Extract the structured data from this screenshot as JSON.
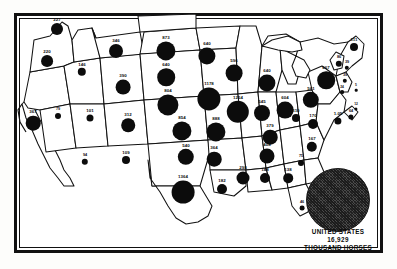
{
  "figure": {
    "type": "proportional-symbol-map",
    "units": "thousand horses"
  },
  "legend": {
    "country_label": "UNITED STATES",
    "amount": "16,929",
    "units_label": "THOUSAND HORSES"
  },
  "chart_data": {
    "type": "scatter",
    "title": "UNITED STATES 16,929 THOUSAND HORSES",
    "xlabel": "",
    "ylabel": "",
    "value_units": "thousand horses",
    "symbol": "graduated circle, area proportional to value",
    "total": 16929,
    "categories": [
      "Washington",
      "Oregon",
      "California",
      "Idaho",
      "Nevada",
      "Montana",
      "Wyoming",
      "Utah",
      "Arizona",
      "Colorado",
      "New Mexico",
      "North Dakota",
      "South Dakota",
      "Nebraska",
      "Kansas",
      "Oklahoma",
      "Texas",
      "Minnesota",
      "Iowa",
      "Missouri",
      "Arkansas",
      "Louisiana",
      "Wisconsin",
      "Illinois",
      "Michigan",
      "Indiana",
      "Ohio",
      "Kentucky",
      "Tennessee",
      "Mississippi",
      "Alabama",
      "Georgia",
      "Florida",
      "South Carolina",
      "North Carolina",
      "Virginia",
      "West Virginia",
      "Pennsylvania",
      "New York",
      "Maryland",
      "Delaware",
      "New Jersey",
      "Maine",
      "Vermont",
      "New Hampshire",
      "Massachusetts",
      "Connecticut",
      "Rhode Island"
    ],
    "values": [
      227,
      220,
      367,
      146,
      79,
      346,
      390,
      101,
      94,
      312,
      109,
      873,
      640,
      1178,
      854,
      540,
      1364,
      640,
      1254,
      888,
      364,
      182,
      596,
      1254,
      640,
      545,
      604,
      379,
      408,
      298,
      148,
      138,
      46,
      75,
      167,
      170,
      110,
      561,
      667,
      105,
      12,
      64,
      111,
      86,
      39,
      39,
      24,
      5
    ],
    "points": [
      {
        "state": "Washington",
        "abbr": "WA",
        "value": 227,
        "label": "227",
        "x": 57,
        "y": 29,
        "r": 6.0
      },
      {
        "state": "Oregon",
        "abbr": "OR",
        "value": 220,
        "label": "220",
        "x": 47,
        "y": 61,
        "r": 5.9
      },
      {
        "state": "California",
        "abbr": "CA",
        "value": 367,
        "label": "367",
        "x": 33,
        "y": 123,
        "r": 7.3
      },
      {
        "state": "Idaho",
        "abbr": "ID",
        "value": 146,
        "label": "146",
        "x": 82,
        "y": 72,
        "r": 4.2
      },
      {
        "state": "Nevada",
        "abbr": "NV",
        "value": 79,
        "label": "79",
        "x": 58,
        "y": 116,
        "r": 3.0
      },
      {
        "state": "Montana",
        "abbr": "MT",
        "value": 346,
        "label": "346",
        "x": 116,
        "y": 51,
        "r": 7.0
      },
      {
        "state": "Wyoming",
        "abbr": "WY",
        "value": 390,
        "label": "390",
        "x": 123,
        "y": 87,
        "r": 7.4
      },
      {
        "state": "Utah",
        "abbr": "UT",
        "value": 101,
        "label": "101",
        "x": 90,
        "y": 118,
        "r": 3.5
      },
      {
        "state": "Arizona",
        "abbr": "AZ",
        "value": 94,
        "label": "94",
        "x": 85,
        "y": 162,
        "r": 3.2
      },
      {
        "state": "Colorado",
        "abbr": "CO",
        "value": 312,
        "label": "312",
        "x": 128,
        "y": 125,
        "r": 6.8
      },
      {
        "state": "New Mexico",
        "abbr": "NM",
        "value": 109,
        "label": "109",
        "x": 126,
        "y": 160,
        "r": 4.0
      },
      {
        "state": "North Dakota",
        "abbr": "ND",
        "value": 873,
        "label": "873",
        "x": 166,
        "y": 51,
        "r": 9.6
      },
      {
        "state": "South Dakota",
        "abbr": "SD",
        "value": 640,
        "label": "640",
        "x": 166,
        "y": 77,
        "r": 8.8
      },
      {
        "state": "Nebraska",
        "abbr": "NE",
        "value": 1178,
        "label": "804",
        "x": 168,
        "y": 105,
        "r": 10.6
      },
      {
        "state": "Kansas",
        "abbr": "KS",
        "value": 854,
        "label": "854",
        "x": 182,
        "y": 131,
        "r": 9.6
      },
      {
        "state": "Oklahoma",
        "abbr": "OK",
        "value": 540,
        "label": "540",
        "x": 186,
        "y": 157,
        "r": 8.2
      },
      {
        "state": "Texas",
        "abbr": "TX",
        "value": 1364,
        "label": "1364",
        "x": 183,
        "y": 192,
        "r": 11.4
      },
      {
        "state": "Minnesota",
        "abbr": "MN",
        "value": 640,
        "label": "640",
        "x": 207,
        "y": 56,
        "r": 8.6
      },
      {
        "state": "Iowa",
        "abbr": "IA",
        "value": 1178,
        "label": "1178",
        "x": 209,
        "y": 99,
        "r": 11.6
      },
      {
        "state": "Missouri",
        "abbr": "MO",
        "value": 888,
        "label": "888",
        "x": 216,
        "y": 132,
        "r": 9.6
      },
      {
        "state": "Arkansas",
        "abbr": "AR",
        "value": 364,
        "label": "364",
        "x": 214,
        "y": 159,
        "r": 7.3
      },
      {
        "state": "Louisiana",
        "abbr": "LA",
        "value": 182,
        "label": "182",
        "x": 222,
        "y": 189,
        "r": 5.0
      },
      {
        "state": "Wisconsin",
        "abbr": "WI",
        "value": 596,
        "label": "596",
        "x": 234,
        "y": 73,
        "r": 8.4
      },
      {
        "state": "Illinois",
        "abbr": "IL",
        "value": 1254,
        "label": "1254",
        "x": 238,
        "y": 112,
        "r": 11.2
      },
      {
        "state": "Michigan",
        "abbr": "MI",
        "value": 640,
        "label": "640",
        "x": 267,
        "y": 83,
        "r": 8.6
      },
      {
        "state": "Indiana",
        "abbr": "IN",
        "value": 545,
        "label": "545",
        "x": 262,
        "y": 113,
        "r": 8.0
      },
      {
        "state": "Ohio",
        "abbr": "OH",
        "value": 604,
        "label": "604",
        "x": 285,
        "y": 110,
        "r": 8.4
      },
      {
        "state": "Kentucky",
        "abbr": "KY",
        "value": 379,
        "label": "379",
        "x": 270,
        "y": 137,
        "r": 7.3
      },
      {
        "state": "Tennessee",
        "abbr": "TN",
        "value": 408,
        "label": "408",
        "x": 267,
        "y": 156,
        "r": 7.5
      },
      {
        "state": "Mississippi",
        "abbr": "MS",
        "value": 298,
        "label": "298",
        "x": 243,
        "y": 178,
        "r": 6.5
      },
      {
        "state": "Alabama",
        "abbr": "AL",
        "value": 148,
        "label": "148",
        "x": 265,
        "y": 178,
        "r": 5.0
      },
      {
        "state": "Georgia",
        "abbr": "GA",
        "value": 138,
        "label": "138",
        "x": 288,
        "y": 178,
        "r": 4.8
      },
      {
        "state": "Florida",
        "abbr": "FL",
        "value": 46,
        "label": "46",
        "x": 302,
        "y": 208,
        "r": 2.4
      },
      {
        "state": "South Carolina",
        "abbr": "SC",
        "value": 75,
        "label": "75",
        "x": 301,
        "y": 163,
        "r": 3.0
      },
      {
        "state": "North Carolina",
        "abbr": "NC",
        "value": 167,
        "label": "167",
        "x": 312,
        "y": 147,
        "r": 5.2
      },
      {
        "state": "Virginia",
        "abbr": "VA",
        "value": 170,
        "label": "170",
        "x": 313,
        "y": 124,
        "r": 5.0
      },
      {
        "state": "West Virginia",
        "abbr": "WV",
        "value": 110,
        "label": "110",
        "x": 296,
        "y": 118,
        "r": 4.0
      },
      {
        "state": "Pennsylvania",
        "abbr": "PA",
        "value": 561,
        "label": "561",
        "x": 311,
        "y": 100,
        "r": 8.2
      },
      {
        "state": "New York",
        "abbr": "NY",
        "value": 667,
        "label": "667",
        "x": 326,
        "y": 80,
        "r": 8.8
      },
      {
        "state": "Maryland",
        "abbr": "MD",
        "value": 105,
        "label": "1.05",
        "x": 338,
        "y": 121,
        "r": 3.6
      },
      {
        "state": "Delaware",
        "abbr": "DE",
        "value": 12,
        "label": "12",
        "x": 356,
        "y": 109,
        "r": 1.6
      },
      {
        "state": "New Jersey",
        "abbr": "NJ",
        "value": 64,
        "label": "64",
        "x": 351,
        "y": 117,
        "r": 2.6
      },
      {
        "state": "Maine",
        "abbr": "ME",
        "value": 111,
        "label": "111",
        "x": 354,
        "y": 47,
        "r": 4.0
      },
      {
        "state": "Vermont",
        "abbr": "VT",
        "value": 86,
        "label": "86",
        "x": 339,
        "y": 64,
        "r": 3.2
      },
      {
        "state": "New Hampshire",
        "abbr": "NH",
        "value": 39,
        "label": "39",
        "x": 347,
        "y": 68,
        "r": 2.2
      },
      {
        "state": "Massachusetts",
        "abbr": "MA",
        "value": 39,
        "label": "39",
        "x": 345,
        "y": 81,
        "r": 2.2
      },
      {
        "state": "Connecticut",
        "abbr": "CT",
        "value": 24,
        "label": "24",
        "x": 342,
        "y": 92,
        "r": 1.9
      },
      {
        "state": "Rhode Island",
        "abbr": "RI",
        "value": 5,
        "label": "5",
        "x": 356,
        "y": 90,
        "r": 1.3
      }
    ]
  },
  "colors": {
    "symbol": "#0c0c0c",
    "frame": "#111111",
    "background": "#ffffff",
    "legend_fill": "#4a4a4a"
  }
}
